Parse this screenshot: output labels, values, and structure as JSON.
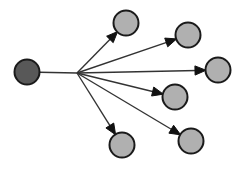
{
  "canvas": {
    "width": 244,
    "height": 171,
    "background": "#ffffff",
    "title": "Directed star graph"
  },
  "style": {
    "source_fill": "#585858",
    "target_fill": "#b0b0b0",
    "node_stroke": "#1a1a1a",
    "node_stroke_width": 2,
    "edge_color": "#333333",
    "edge_width": 1.4,
    "arrow_color": "#111111",
    "node_radius": 12.5
  },
  "graph": {
    "type": "directed-star",
    "node_count": 7,
    "edge_count": 6,
    "hub": {
      "x": 77,
      "y": 73,
      "label": "fan-out-point"
    },
    "nodes": [
      {
        "id": "n0",
        "role": "source",
        "label": "source-node",
        "x": 27,
        "y": 72,
        "r": 12.5,
        "fill": "#585858"
      },
      {
        "id": "n1",
        "role": "target",
        "label": "target-node-1",
        "x": 126,
        "y": 23,
        "r": 12.5,
        "fill": "#b0b0b0"
      },
      {
        "id": "n2",
        "role": "target",
        "label": "target-node-2",
        "x": 188,
        "y": 35,
        "r": 12.5,
        "fill": "#b0b0b0"
      },
      {
        "id": "n3",
        "role": "target",
        "label": "target-node-3",
        "x": 218,
        "y": 70,
        "r": 12.5,
        "fill": "#b0b0b0"
      },
      {
        "id": "n4",
        "role": "target",
        "label": "target-node-4",
        "x": 175,
        "y": 97,
        "r": 12.5,
        "fill": "#b0b0b0"
      },
      {
        "id": "n5",
        "role": "target",
        "label": "target-node-5",
        "x": 191,
        "y": 141,
        "r": 12.5,
        "fill": "#b0b0b0"
      },
      {
        "id": "n6",
        "role": "target",
        "label": "target-node-6",
        "x": 122,
        "y": 145,
        "r": 12.5,
        "fill": "#b0b0b0"
      }
    ],
    "edges": [
      {
        "id": "e0",
        "from": "n0",
        "to": "hub",
        "directed": false,
        "label": "edge-source-to-hub"
      },
      {
        "id": "e1",
        "from": "hub",
        "to": "n1",
        "directed": true,
        "label": "edge-hub-to-target-1"
      },
      {
        "id": "e2",
        "from": "hub",
        "to": "n2",
        "directed": true,
        "label": "edge-hub-to-target-2"
      },
      {
        "id": "e3",
        "from": "hub",
        "to": "n3",
        "directed": true,
        "label": "edge-hub-to-target-3"
      },
      {
        "id": "e4",
        "from": "hub",
        "to": "n4",
        "directed": true,
        "label": "edge-hub-to-target-4"
      },
      {
        "id": "e5",
        "from": "hub",
        "to": "n5",
        "directed": true,
        "label": "edge-hub-to-target-5"
      },
      {
        "id": "e6",
        "from": "hub",
        "to": "n6",
        "directed": true,
        "label": "edge-hub-to-target-6"
      }
    ]
  }
}
